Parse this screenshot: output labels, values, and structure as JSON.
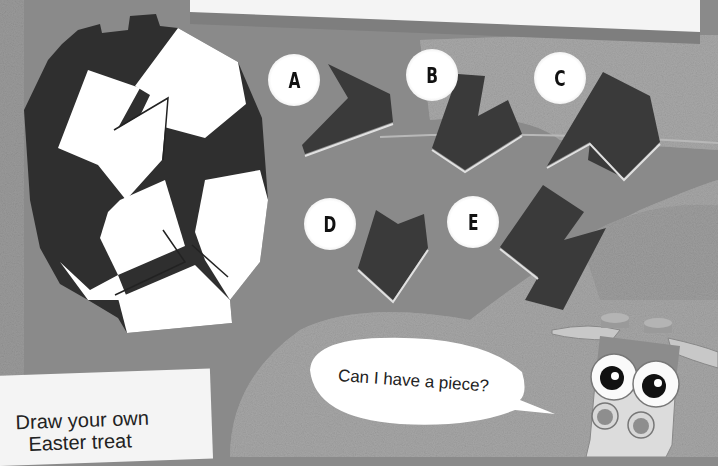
{
  "page": {
    "type": "activity-book-puzzle",
    "colors": {
      "background": "#8a8a8a",
      "speckle": "#a6a6a6",
      "piece_dark": "#3a3a3a",
      "egg_white": "#ffffff",
      "card": "#f4f4f4"
    }
  },
  "puzzle": {
    "options": [
      {
        "label": "A"
      },
      {
        "label": "B"
      },
      {
        "label": "C"
      },
      {
        "label": "D"
      },
      {
        "label": "E"
      }
    ]
  },
  "character": {
    "speech": "Can I have a piece?"
  },
  "prompt_card": {
    "line1": "Draw your own",
    "line2": "Easter treat"
  }
}
